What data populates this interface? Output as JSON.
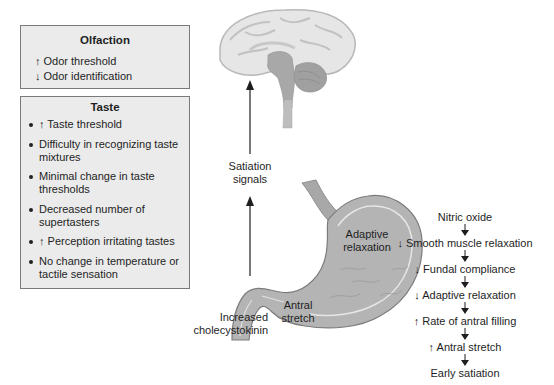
{
  "olfaction": {
    "title": "Olfaction",
    "items": [
      "↑ Odor threshold",
      "↓ Odor identification"
    ]
  },
  "taste": {
    "title": "Taste",
    "items": [
      "↑ Taste threshold",
      "Difficulty in recognizing taste mixtures",
      "Minimal change in taste thresholds",
      "Decreased number of supertasters",
      "↑ Perception irritating tastes",
      "No change in temperature or tactile sensation"
    ]
  },
  "labels": {
    "satiation_signals_1": "Satiation",
    "satiation_signals_2": "signals",
    "cck_1": "Increased",
    "cck_2": "cholecystokinin",
    "adaptive_1": "Adaptive",
    "adaptive_2": "relaxation",
    "antral_1": "Antral",
    "antral_2": "stretch"
  },
  "chain": {
    "steps": [
      "Nitric oxide",
      "↓ Smooth muscle relaxation",
      "↓ Fundal compliance",
      "↓ Adaptive relaxation",
      "↑ Rate of antral filling",
      "↑ Antral stretch",
      "Early satiation"
    ]
  },
  "colors": {
    "box_fill": "#ebebeb",
    "box_border": "#7a7a7a",
    "brain_fill": "#e6e6e6",
    "brainstem_fill": "#a8a8a8",
    "stomach_fill": "#b4b4b4",
    "arrow": "#1e1e1e"
  }
}
